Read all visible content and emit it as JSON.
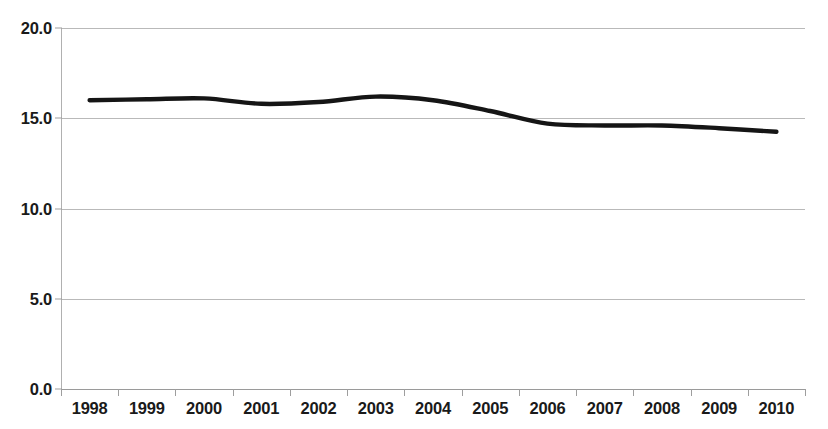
{
  "chart_data": {
    "type": "line",
    "title": "",
    "subtitle": "",
    "xlabel": "",
    "ylabel": "",
    "categories": [
      "1998",
      "1999",
      "2000",
      "2001",
      "2002",
      "2003",
      "2004",
      "2005",
      "2006",
      "2007",
      "2008",
      "2009",
      "2010"
    ],
    "x": [
      1998,
      1999,
      2000,
      2001,
      2002,
      2003,
      2004,
      2005,
      2006,
      2007,
      2008,
      2009,
      2010
    ],
    "series": [
      {
        "name": "",
        "values": [
          16.0,
          16.05,
          16.1,
          15.8,
          15.9,
          16.2,
          16.0,
          15.4,
          14.7,
          14.6,
          14.6,
          14.45,
          14.25
        ],
        "color": "#151515",
        "line_width": 4.4
      }
    ],
    "ylim": [
      0.0,
      20.0
    ],
    "y_ticks": [
      0.0,
      5.0,
      10.0,
      15.0,
      20.0
    ],
    "y_tick_labels": [
      "0.0",
      "5.0",
      "10.0",
      "15.0",
      "20.0"
    ],
    "grid": true,
    "grid_axis": "y",
    "grid_color": "#b9b9b9",
    "legend": false,
    "legend_position": "none",
    "background": "#ffffff",
    "annotations": []
  },
  "axes": {
    "y_axis_name": "y-axis",
    "x_axis_name": "x-axis"
  }
}
